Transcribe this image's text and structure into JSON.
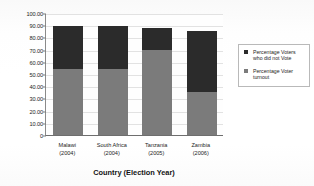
{
  "chart_data": {
    "type": "bar",
    "stacked": true,
    "title": "",
    "xlabel": "Country (Election Year)",
    "ylabel": "Voter Turnout Percentage",
    "categories": [
      "Malawi\n(2004)",
      "South Africa\n(2004)",
      "Tanzania\n(2005)",
      "Zambia\n(2006)"
    ],
    "category_lines": [
      {
        "name": "Malawi",
        "year": "(2004)"
      },
      {
        "name": "South Africa",
        "year": "(2004)"
      },
      {
        "name": "Tanzania",
        "year": "(2005)"
      },
      {
        "name": "Zambia",
        "year": "(2006)"
      }
    ],
    "series": [
      {
        "name": "Percentage Voter turnout",
        "values": [
          54.5,
          54.5,
          70.0,
          35.0
        ],
        "color": "#7b7b7b"
      },
      {
        "name": "Percentage Voters who did not Vote",
        "values": [
          34.5,
          34.5,
          17.5,
          50.0
        ],
        "color": "#2b2b2b"
      }
    ],
    "totals": [
      89.0,
      89.0,
      87.5,
      85.0
    ],
    "ylim": [
      0,
      100
    ],
    "yticks": [
      "100.00",
      "90.00",
      "80.00",
      "70.00",
      "60.00",
      "50.00",
      "40.00",
      "30.00",
      "20.00",
      "10.00",
      "0"
    ],
    "ytick_values": [
      100,
      90,
      80,
      70,
      60,
      50,
      40,
      30,
      20,
      10,
      0
    ],
    "grid": true,
    "legend_position": "right"
  },
  "legend": {
    "items": [
      {
        "label_line1": "Percentage Voters",
        "label_line2": "who did not Vote",
        "swatch": "#2b2b2b"
      },
      {
        "label_line1": "Percentage Voter",
        "label_line2": "turnout",
        "swatch": "#7b7b7b"
      }
    ]
  }
}
